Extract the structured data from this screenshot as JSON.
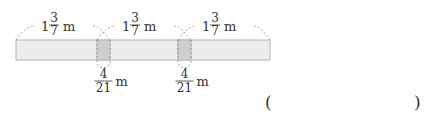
{
  "diagram": {
    "strip_count": 3,
    "overlap_count": 2,
    "strip_length": {
      "whole": "1",
      "numerator": "3",
      "denominator": "7",
      "unit": "m"
    },
    "overlap_length": {
      "numerator": "4",
      "denominator": "21",
      "unit": "m"
    },
    "colors": {
      "strip_fill": "#ececec",
      "strip_stroke": "#b4b4b4",
      "overlap_fill": "#cfcfcf",
      "dashed_line": "#9a9a9a",
      "text": "#333333"
    }
  },
  "answer": {
    "open_paren": "(",
    "close_paren": ")",
    "value": ""
  }
}
